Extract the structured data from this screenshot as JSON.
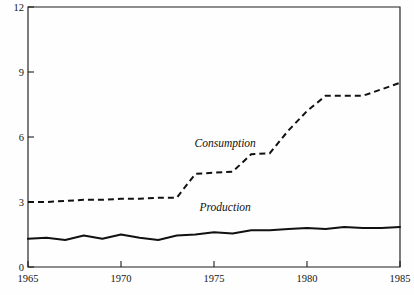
{
  "chart_data": {
    "type": "line",
    "title": "",
    "subtitle": "",
    "xlabel": "",
    "ylabel": "",
    "xlim": [
      1965,
      1985
    ],
    "ylim": [
      0,
      12
    ],
    "grid": false,
    "legend_position": "inline-annotation",
    "x_ticks": [
      1965,
      1970,
      1975,
      1980,
      1985
    ],
    "x_tick_labels": [
      "1965",
      "1970",
      "1975",
      "1980",
      "1985"
    ],
    "y_ticks": [
      0,
      3,
      6,
      9,
      12
    ],
    "y_tick_labels": [
      "0",
      "3",
      "6",
      "9",
      "12"
    ],
    "x": [
      1965,
      1966,
      1967,
      1968,
      1969,
      1970,
      1971,
      1972,
      1973,
      1974,
      1975,
      1976,
      1977,
      1978,
      1979,
      1980,
      1981,
      1982,
      1983,
      1984,
      1985
    ],
    "series": [
      {
        "name": "Consumption",
        "style": "dashed",
        "values": [
          3.0,
          3.0,
          3.05,
          3.1,
          3.1,
          3.15,
          3.15,
          3.2,
          3.2,
          4.3,
          4.35,
          4.4,
          5.2,
          5.25,
          6.3,
          7.2,
          7.9,
          7.9,
          7.9,
          8.2,
          8.5
        ]
      },
      {
        "name": "Production",
        "style": "solid",
        "values": [
          1.3,
          1.35,
          1.25,
          1.45,
          1.3,
          1.5,
          1.35,
          1.25,
          1.45,
          1.5,
          1.6,
          1.55,
          1.7,
          1.7,
          1.75,
          1.8,
          1.75,
          1.85,
          1.8,
          1.8,
          1.85
        ]
      }
    ],
    "annotations": [
      {
        "text": "Consumption",
        "x": 1975.6,
        "y": 5.55
      },
      {
        "text": "Production",
        "x": 1975.6,
        "y": 2.6
      }
    ]
  },
  "axes": {
    "y_labels": [
      "12",
      "9",
      "6",
      "3",
      "0"
    ],
    "x_labels": [
      "1965",
      "1970",
      "1975",
      "1980",
      "1985"
    ]
  },
  "labels": {
    "consumption": "Consumption",
    "production": "Production"
  },
  "colors": {
    "line": "#111111",
    "axis": "#1c1c1c",
    "background": "#fefefe"
  }
}
